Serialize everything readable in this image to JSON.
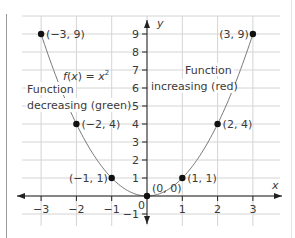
{
  "chart_data": {
    "type": "line",
    "title": "",
    "function_label": "f(x) = x²",
    "xlabel": "x",
    "ylabel": "y",
    "xlim": [
      -3.5,
      3.6
    ],
    "ylim": [
      -1.6,
      10.2
    ],
    "grid": true,
    "x_ticks": [
      -3,
      -2,
      -1,
      1,
      2,
      3
    ],
    "y_ticks": [
      -1,
      1,
      2,
      3,
      4,
      5,
      6,
      7,
      8,
      9
    ],
    "origin_label": "0",
    "series": [
      {
        "name": "f(x) = x²",
        "x": [
          -3,
          -2,
          -1,
          0,
          1,
          2,
          3
        ],
        "y": [
          9,
          4,
          1,
          0,
          1,
          4,
          9
        ]
      }
    ],
    "points": [
      {
        "x": -3,
        "y": 9,
        "label": "(−3, 9)"
      },
      {
        "x": -2,
        "y": 4,
        "label": "(−2, 4)"
      },
      {
        "x": -1,
        "y": 1,
        "label": "(−1, 1)"
      },
      {
        "x": 0,
        "y": 0,
        "label": "(0, 0)"
      },
      {
        "x": 1,
        "y": 1,
        "label": "(1, 1)"
      },
      {
        "x": 2,
        "y": 4,
        "label": "(2, 4)"
      },
      {
        "x": 3,
        "y": 9,
        "label": "(3, 9)"
      }
    ],
    "annotations": {
      "decreasing_line1": "Function",
      "decreasing_line2": "decreasing (green)",
      "increasing_line1": "Function",
      "increasing_line2": "increasing (red)"
    },
    "colors": {
      "curve": "#7a7a7a",
      "axis": "#222222",
      "grid": "#d4d4d4",
      "point": "#111111"
    }
  }
}
